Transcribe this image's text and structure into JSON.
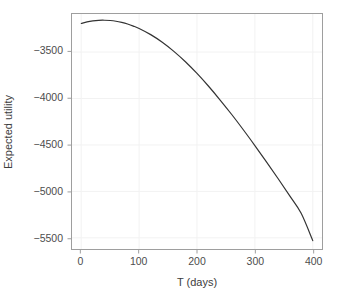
{
  "chart_data": {
    "type": "line",
    "title": "",
    "xlabel": "T (days)",
    "ylabel": "Expected utility",
    "xlim": [
      -16,
      416
    ],
    "ylim": [
      -5620,
      -3090
    ],
    "xticks": [
      0,
      100,
      200,
      300,
      400
    ],
    "xtick_labels": [
      "0",
      "100",
      "200",
      "300",
      "400"
    ],
    "yticks": [
      -3500,
      -4000,
      -4500,
      -5000,
      -5500
    ],
    "ytick_labels": [
      "−3500",
      "−4000",
      "−4500",
      "−5000",
      "−5500"
    ],
    "grid": true,
    "legend": "none",
    "series": [
      {
        "name": "Expected utility",
        "color": "#333333",
        "x": [
          0,
          10,
          20,
          30,
          40,
          50,
          60,
          70,
          80,
          90,
          100,
          120,
          140,
          160,
          180,
          200,
          220,
          240,
          260,
          280,
          300,
          320,
          340,
          360,
          380,
          400
        ],
        "y": [
          -3192,
          -3175,
          -3164,
          -3158,
          -3157,
          -3160,
          -3168,
          -3181,
          -3198,
          -3220,
          -3246,
          -3312,
          -3394,
          -3492,
          -3604,
          -3730,
          -3868,
          -4016,
          -4172,
          -4336,
          -4506,
          -4681,
          -4861,
          -5046,
          -5236,
          -5530
        ]
      }
    ],
    "annotations": []
  },
  "style": {
    "panel_background": "#ffffff",
    "panel_border": "#9e9e9e",
    "grid_color": "#f2f2f2",
    "text_color": "#4d4d4d",
    "line_color": "#333333"
  }
}
